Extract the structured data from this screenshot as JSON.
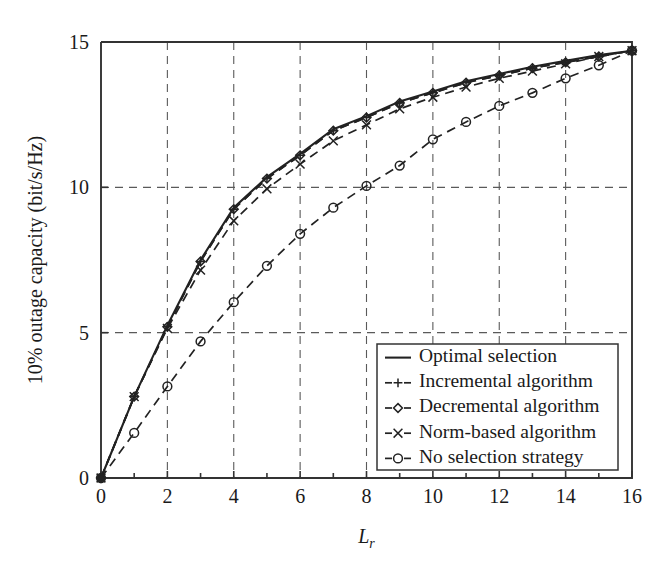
{
  "figure": {
    "background_color": "#ffffff",
    "line_color": "#222222",
    "grid_color": "#5a5a5a",
    "axis_color": "#333333"
  },
  "chart_data": {
    "type": "line",
    "title": "",
    "subtitle": "",
    "xlabel": "L",
    "xlabel_subscript": "r",
    "ylabel": "10% outage capacity (bit/s/Hz)",
    "xlim": [
      0,
      16
    ],
    "ylim": [
      0,
      15
    ],
    "xticks": [
      0,
      2,
      4,
      6,
      8,
      10,
      12,
      14,
      16
    ],
    "xticklabels": [
      "0",
      "2",
      "4",
      "6",
      "8",
      "10",
      "12",
      "14",
      "16"
    ],
    "xminorticks": [
      1,
      3,
      5,
      7,
      9,
      11,
      13,
      15
    ],
    "yticks": [
      0,
      5,
      10,
      15
    ],
    "yticklabels": [
      "0",
      "5",
      "10",
      "15"
    ],
    "grid": true,
    "grid_style": "dashed",
    "legend_position": "lower right",
    "x": [
      0,
      1,
      2,
      3,
      4,
      5,
      6,
      7,
      8,
      9,
      10,
      11,
      12,
      13,
      14,
      15,
      16
    ],
    "series": [
      {
        "name": "Optimal selection",
        "marker": "none",
        "linestyle": "solid",
        "values": [
          0,
          2.8,
          5.25,
          7.5,
          9.3,
          10.35,
          11.15,
          12.0,
          12.45,
          12.95,
          13.3,
          13.65,
          13.9,
          14.15,
          14.35,
          14.55,
          14.7
        ]
      },
      {
        "name": "Incremental algorithm",
        "marker": "plus",
        "linestyle": "dashed",
        "values": [
          0,
          2.8,
          5.2,
          7.45,
          9.25,
          10.3,
          11.1,
          11.95,
          12.4,
          12.9,
          13.25,
          13.6,
          13.85,
          14.1,
          14.3,
          14.5,
          14.7
        ]
      },
      {
        "name": "Decremental algorithm",
        "marker": "diamond",
        "linestyle": "dashed",
        "values": [
          0,
          2.8,
          5.2,
          7.45,
          9.25,
          10.3,
          11.1,
          11.95,
          12.4,
          12.9,
          13.25,
          13.6,
          13.85,
          14.1,
          14.3,
          14.5,
          14.7
        ]
      },
      {
        "name": "Norm-based algorithm",
        "marker": "x",
        "linestyle": "dashed",
        "values": [
          0,
          2.8,
          5.15,
          7.15,
          8.85,
          9.95,
          10.8,
          11.6,
          12.15,
          12.7,
          13.1,
          13.45,
          13.75,
          14.0,
          14.25,
          14.5,
          14.7
        ]
      },
      {
        "name": "No selection strategy",
        "marker": "circle",
        "linestyle": "dashed",
        "values": [
          0,
          1.55,
          3.15,
          4.7,
          6.05,
          7.3,
          8.4,
          9.3,
          10.05,
          10.75,
          11.65,
          12.25,
          12.8,
          13.25,
          13.75,
          14.2,
          14.7
        ]
      }
    ]
  },
  "legend": {
    "items": [
      {
        "label": "Optimal selection",
        "marker": "none",
        "linestyle": "solid"
      },
      {
        "label": "Incremental algorithm",
        "marker": "plus",
        "linestyle": "dashed"
      },
      {
        "label": "Decremental algorithm",
        "marker": "diamond",
        "linestyle": "dashed"
      },
      {
        "label": "Norm-based algorithm",
        "marker": "x",
        "linestyle": "dashed"
      },
      {
        "label": "No selection strategy",
        "marker": "circle",
        "linestyle": "dashed"
      }
    ]
  }
}
